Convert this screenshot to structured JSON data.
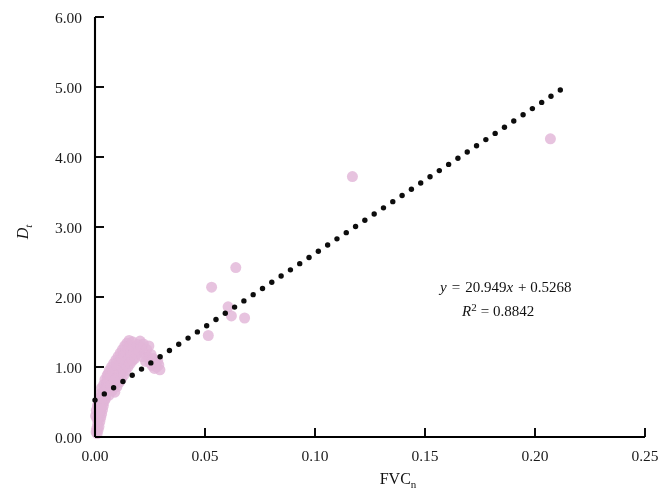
{
  "figure": {
    "background": "#ffffff",
    "point_color": "#e2b6d8",
    "point_overlap_color": "#9c4a8c",
    "trendline_color": "#0d0d0d",
    "axis_color": "#000000"
  },
  "axes": {
    "x_title_main": "FVC",
    "x_title_sub": "n",
    "y_title_main": "D",
    "y_title_sub": "t",
    "x_ticks": [
      "0.00",
      "0.05",
      "0.10",
      "0.15",
      "0.20",
      "0.25"
    ],
    "y_ticks": [
      "0.00",
      "1.00",
      "2.00",
      "3.00",
      "4.00",
      "5.00",
      "6.00"
    ]
  },
  "annotations": {
    "equation_y": "y",
    "equation_eq": "=",
    "equation_body": "20.949",
    "equation_x": "x",
    "equation_tail": "+ 0.5268",
    "r2_symbol": "R",
    "r2_exp": "2",
    "r2_eq": "= 0.8842"
  },
  "chart_data": {
    "type": "scatter",
    "title": "",
    "xlabel": "FVCn",
    "ylabel": "Dt",
    "xlim": [
      0.0,
      0.25
    ],
    "ylim": [
      0.0,
      6.0
    ],
    "xticks": [
      0.0,
      0.05,
      0.1,
      0.15,
      0.2,
      0.25
    ],
    "yticks": [
      0.0,
      1.0,
      2.0,
      3.0,
      4.0,
      5.0,
      6.0
    ],
    "grid": false,
    "legend": null,
    "marker": {
      "shape": "circle",
      "size_px": 11,
      "color": "#e2b6d8",
      "opacity": 0.82
    },
    "annotations": [
      {
        "text": "y = 20.949x + 0.5268",
        "x": 0.168,
        "y": 2.27
      },
      {
        "text": "R² = 0.8842",
        "x": 0.178,
        "y": 1.93
      }
    ],
    "trendline": {
      "type": "linear",
      "style": "dotted",
      "slope": 20.949,
      "intercept": 0.5268,
      "r_squared": 0.8842,
      "x_start": 0.0,
      "x_end": 0.2115
    },
    "points": [
      [
        0.0005,
        0.07
      ],
      [
        0.0008,
        0.12
      ],
      [
        0.001,
        0.05
      ],
      [
        0.0012,
        0.18
      ],
      [
        0.0014,
        0.1
      ],
      [
        0.0016,
        0.24
      ],
      [
        0.0018,
        0.15
      ],
      [
        0.002,
        0.3
      ],
      [
        0.0022,
        0.22
      ],
      [
        0.0024,
        0.36
      ],
      [
        0.0026,
        0.28
      ],
      [
        0.0028,
        0.42
      ],
      [
        0.003,
        0.33
      ],
      [
        0.0032,
        0.48
      ],
      [
        0.0034,
        0.39
      ],
      [
        0.0036,
        0.54
      ],
      [
        0.0038,
        0.45
      ],
      [
        0.004,
        0.6
      ],
      [
        0.0042,
        0.51
      ],
      [
        0.0044,
        0.66
      ],
      [
        0.0046,
        0.57
      ],
      [
        0.0048,
        0.72
      ],
      [
        0.005,
        0.63
      ],
      [
        0.0052,
        0.78
      ],
      [
        0.0054,
        0.69
      ],
      [
        0.0056,
        0.84
      ],
      [
        0.0058,
        0.74
      ],
      [
        0.006,
        0.9
      ],
      [
        0.002,
        0.55
      ],
      [
        0.0025,
        0.62
      ],
      [
        0.003,
        0.7
      ],
      [
        0.0035,
        0.58
      ],
      [
        0.004,
        0.75
      ],
      [
        0.0045,
        0.82
      ],
      [
        0.005,
        0.68
      ],
      [
        0.0055,
        0.88
      ],
      [
        0.006,
        0.79
      ],
      [
        0.0065,
        0.95
      ],
      [
        0.007,
        0.86
      ],
      [
        0.0075,
        1.0
      ],
      [
        0.008,
        0.92
      ],
      [
        0.0085,
        1.05
      ],
      [
        0.009,
        0.98
      ],
      [
        0.0095,
        1.1
      ],
      [
        0.01,
        1.02
      ],
      [
        0.0105,
        1.15
      ],
      [
        0.011,
        1.08
      ],
      [
        0.0115,
        1.2
      ],
      [
        0.012,
        1.12
      ],
      [
        0.0125,
        1.25
      ],
      [
        0.013,
        1.18
      ],
      [
        0.0135,
        1.3
      ],
      [
        0.008,
        0.7
      ],
      [
        0.0085,
        0.76
      ],
      [
        0.009,
        0.64
      ],
      [
        0.0095,
        0.8
      ],
      [
        0.01,
        0.72
      ],
      [
        0.0105,
        0.86
      ],
      [
        0.011,
        0.78
      ],
      [
        0.0115,
        0.9
      ],
      [
        0.012,
        0.83
      ],
      [
        0.0125,
        0.96
      ],
      [
        0.013,
        0.88
      ],
      [
        0.0135,
        1.02
      ],
      [
        0.014,
        1.22
      ],
      [
        0.0145,
        1.34
      ],
      [
        0.015,
        1.27
      ],
      [
        0.0155,
        1.38
      ],
      [
        0.016,
        1.31
      ],
      [
        0.0165,
        1.24
      ],
      [
        0.017,
        1.36
      ],
      [
        0.0175,
        1.29
      ],
      [
        0.014,
        0.95
      ],
      [
        0.0145,
        1.08
      ],
      [
        0.015,
        1.0
      ],
      [
        0.0155,
        1.13
      ],
      [
        0.016,
        1.05
      ],
      [
        0.0165,
        1.16
      ],
      [
        0.017,
        1.09
      ],
      [
        0.0175,
        1.19
      ],
      [
        0.018,
        1.12
      ],
      [
        0.0185,
        1.26
      ],
      [
        0.019,
        1.18
      ],
      [
        0.0195,
        1.32
      ],
      [
        0.02,
        1.23
      ],
      [
        0.0205,
        1.37
      ],
      [
        0.021,
        1.28
      ],
      [
        0.0215,
        1.15
      ],
      [
        0.022,
        1.33
      ],
      [
        0.0225,
        1.2
      ],
      [
        0.023,
        1.08
      ],
      [
        0.0235,
        1.25
      ],
      [
        0.024,
        1.14
      ],
      [
        0.0245,
        1.3
      ],
      [
        0.025,
        1.06
      ],
      [
        0.0255,
        1.18
      ],
      [
        0.026,
        1.02
      ],
      [
        0.0265,
        1.12
      ],
      [
        0.027,
        0.98
      ],
      [
        0.0275,
        1.05
      ],
      [
        0.028,
        1.0
      ],
      [
        0.0285,
        1.09
      ],
      [
        0.029,
        1.03
      ],
      [
        0.0295,
        0.96
      ],
      [
        0.0012,
        0.45
      ],
      [
        0.0018,
        0.52
      ],
      [
        0.0022,
        0.4
      ],
      [
        0.0028,
        0.58
      ],
      [
        0.0034,
        0.48
      ],
      [
        0.0042,
        0.64
      ],
      [
        0.0048,
        0.55
      ],
      [
        0.0056,
        0.7
      ],
      [
        0.0064,
        0.6
      ],
      [
        0.0072,
        0.74
      ],
      [
        0.0078,
        0.66
      ],
      [
        0.0088,
        0.81
      ],
      [
        0.0003,
        0.3
      ],
      [
        0.0006,
        0.38
      ],
      [
        0.0009,
        0.26
      ],
      [
        0.0013,
        0.44
      ],
      [
        0.0015,
        0.34
      ],
      [
        0.0019,
        0.5
      ],
      [
        0.0023,
        0.42
      ],
      [
        0.0027,
        0.56
      ],
      [
        0.0515,
        1.45
      ],
      [
        0.053,
        2.14
      ],
      [
        0.0605,
        1.86
      ],
      [
        0.062,
        1.73
      ],
      [
        0.064,
        2.42
      ],
      [
        0.068,
        1.7
      ],
      [
        0.117,
        3.72
      ],
      [
        0.207,
        4.26
      ]
    ]
  }
}
